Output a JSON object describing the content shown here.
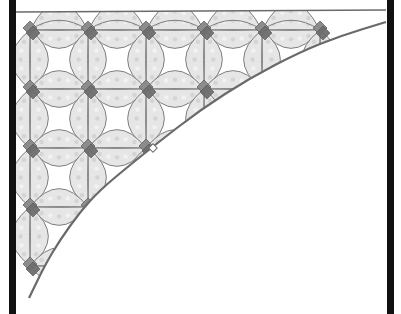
{
  "canvas": {
    "width": 401,
    "height": 314,
    "background": "#ffffff"
  },
  "colors": {
    "border": "#111111",
    "outline": "#707070",
    "ring_fill_light": "#e6e6e6",
    "ring_fill_mid": "#d2d2d2",
    "diamond_dark": "#6e6e6e",
    "diamond_mid": "#8c8c8c",
    "curve": "#6a6a6a",
    "top_line": "#6a6a6a"
  },
  "frame": {
    "left_border": {
      "x": 9,
      "width": 7
    },
    "right_border": {
      "x": 387,
      "width": 7
    },
    "top_line": {
      "x1": 16,
      "y1": 12,
      "x2": 386,
      "y2": 10
    }
  },
  "grid": {
    "columns_x": [
      30,
      88,
      146,
      204,
      262,
      320
    ],
    "rows_y": [
      30,
      89,
      148,
      207,
      266
    ],
    "spacing": 58.5,
    "ring_half_width": 9
  },
  "curve": {
    "points": [
      [
        29,
        298
      ],
      [
        45,
        265
      ],
      [
        60,
        240
      ],
      [
        80,
        212
      ],
      [
        100,
        190
      ],
      [
        130,
        165
      ],
      [
        155,
        145
      ],
      [
        200,
        110
      ],
      [
        250,
        78
      ],
      [
        300,
        52
      ],
      [
        340,
        36
      ],
      [
        386,
        22
      ]
    ]
  },
  "notch": {
    "x": 153,
    "y": 148,
    "size": 6
  }
}
